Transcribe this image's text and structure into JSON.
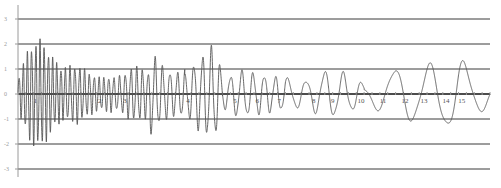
{
  "chart_data": {
    "type": "line",
    "title": "",
    "xlabel": "",
    "ylabel": "",
    "xlim": [
      0,
      15
    ],
    "ylim": [
      -3,
      3
    ],
    "grid": true,
    "legend": "none",
    "y_ticks": [
      3,
      2,
      1,
      0,
      -1,
      -2,
      -3
    ],
    "x_ticks": [
      1,
      2,
      3,
      4,
      5,
      6,
      7,
      8,
      9,
      10,
      11,
      12,
      13,
      14,
      15
    ],
    "x_tick_positions": [
      0.55,
      2.6,
      3.4,
      5.4,
      6.9,
      7.6,
      8.3,
      9.4,
      10.0,
      10.9,
      11.6,
      12.3,
      12.9,
      13.6,
      14.1
    ],
    "series": [
      {
        "name": "signal",
        "color": "#555555",
        "segments": [
          {
            "t_start": 0.0,
            "t_end": 1.5,
            "freq": 7.5,
            "amp": [
              0.6,
              1.8,
              2.0,
              1.3,
              0.9
            ]
          },
          {
            "t_start": 1.5,
            "t_end": 3.0,
            "freq": 6.5,
            "amp": [
              1.0,
              1.1,
              0.8,
              0.6,
              0.7
            ]
          },
          {
            "t_start": 3.0,
            "t_end": 4.2,
            "freq": 5.5,
            "amp": [
              0.6,
              0.7,
              1.0,
              1.0,
              0.8
            ]
          },
          {
            "t_start": 4.2,
            "t_end": 5.3,
            "freq": 4.2,
            "amp": [
              1.6,
              1.2,
              0.9,
              0.8,
              0.9
            ]
          },
          {
            "t_start": 5.3,
            "t_end": 6.5,
            "freq": 3.6,
            "amp": [
              0.7,
              1.2,
              1.5,
              1.8,
              0.9
            ]
          },
          {
            "t_start": 6.5,
            "t_end": 8.5,
            "freq": 2.8,
            "amp": [
              0.5,
              0.9,
              0.8,
              0.7,
              0.6
            ]
          },
          {
            "t_start": 8.5,
            "t_end": 11.0,
            "freq": 1.7,
            "amp": [
              0.6,
              0.5,
              0.9,
              0.8,
              0.4
            ]
          },
          {
            "t_start": 11.0,
            "t_end": 15.0,
            "freq": 0.9,
            "amp": [
              0.3,
              1.0,
              1.1,
              1.4,
              0.4
            ]
          }
        ]
      }
    ]
  }
}
